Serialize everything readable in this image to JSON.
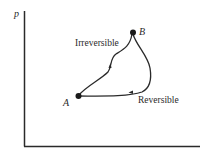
{
  "diagram": {
    "type": "p-V state diagram",
    "axes": {
      "y_label": "p",
      "x_label": ""
    },
    "states": [
      {
        "id": "A",
        "label": "A"
      },
      {
        "id": "B",
        "label": "B"
      }
    ],
    "paths": [
      {
        "id": "irreversible",
        "label": "Irreversible",
        "from": "A",
        "to": "B"
      },
      {
        "id": "reversible",
        "label": "Reversible",
        "from": "B",
        "to": "A"
      }
    ],
    "colors": {
      "line": "#2a2a2a",
      "background": "#ffffff"
    }
  }
}
